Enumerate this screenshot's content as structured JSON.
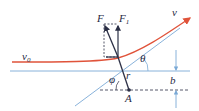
{
  "diagram": {
    "type": "physics-scattering-trajectory",
    "colors": {
      "trajectory": "#e0533a",
      "guide_lines": "#7aa9d6",
      "force": "#2b2f45",
      "text": "#1f2a44"
    },
    "labels": {
      "v0": "v",
      "v0_sub": "0",
      "v": "v",
      "F": "F",
      "F1": "F",
      "F1_sub": "1",
      "theta": "θ",
      "phi": "φ",
      "r": "r",
      "A": "A",
      "b": "b"
    }
  }
}
